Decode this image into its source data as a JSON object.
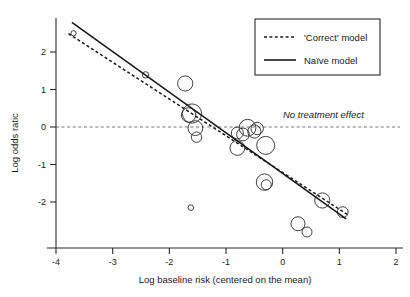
{
  "chart_data": {
    "type": "scatter",
    "title": "",
    "xlabel": "Log baseline risk (centered on the mean)",
    "ylabel": "Log odds ratic",
    "xlim": [
      -4.35,
      2.15
    ],
    "ylim": [
      -3.05,
      2.85
    ],
    "xticks": [
      -4,
      -3,
      -2,
      -1,
      0,
      1,
      2
    ],
    "xticklabels": [
      "-4",
      "-3",
      "-2",
      "-1",
      "0",
      "1",
      "2"
    ],
    "yticks": [
      2,
      1,
      0,
      -1,
      -2
    ],
    "yticklabels": [
      "2",
      "1",
      "0",
      "-1",
      "-2"
    ],
    "grid": false,
    "legend_position": "top-right",
    "annotations": [
      {
        "text": "No treatment effect",
        "x": 0.1,
        "y": 0.18,
        "style": "italic"
      }
    ],
    "reference_lines": [
      {
        "name": "no-treatment-effect",
        "orientation": "horizontal",
        "y": 0,
        "style": "dotted",
        "color": "#777777"
      }
    ],
    "series": [
      {
        "name": "Studies",
        "type": "bubble",
        "marker": "open-circle",
        "points": [
          {
            "x": -3.69,
            "y": 2.5,
            "size": 2.6
          },
          {
            "x": -2.42,
            "y": 1.39,
            "size": 3.2
          },
          {
            "x": -1.72,
            "y": 1.16,
            "size": 7.6
          },
          {
            "x": -1.6,
            "y": 0.36,
            "size": 9.6
          },
          {
            "x": -1.66,
            "y": 0.32,
            "size": 7.2
          },
          {
            "x": -1.54,
            "y": -0.03,
            "size": 7.4
          },
          {
            "x": -1.52,
            "y": -0.27,
            "size": 5.2
          },
          {
            "x": -0.8,
            "y": -0.16,
            "size": 6.0
          },
          {
            "x": -0.7,
            "y": -0.2,
            "size": 6.4
          },
          {
            "x": -0.62,
            "y": -0.02,
            "size": 8.4
          },
          {
            "x": -0.5,
            "y": -0.12,
            "size": 6.6
          },
          {
            "x": -0.45,
            "y": -0.04,
            "size": 6.2
          },
          {
            "x": -0.8,
            "y": -0.56,
            "size": 7.4
          },
          {
            "x": -0.3,
            "y": -0.49,
            "size": 9.0
          },
          {
            "x": -0.32,
            "y": -1.47,
            "size": 8.2
          },
          {
            "x": -0.29,
            "y": -1.54,
            "size": 5.0
          },
          {
            "x": -1.62,
            "y": -2.15,
            "size": 2.8
          },
          {
            "x": 0.7,
            "y": -1.96,
            "size": 7.6
          },
          {
            "x": 1.06,
            "y": -2.27,
            "size": 5.4
          },
          {
            "x": 0.27,
            "y": -2.58,
            "size": 7.0
          },
          {
            "x": 0.43,
            "y": -2.8,
            "size": 5.0
          }
        ]
      }
    ],
    "fitted_lines": [
      {
        "name": "Naïve model",
        "style": "solid",
        "x0": -3.72,
        "y0": 2.79,
        "x1": 1.12,
        "y1": -2.45
      },
      {
        "name": "'Correct' model",
        "style": "dotted",
        "x0": -3.78,
        "y0": 2.49,
        "x1": 1.15,
        "y1": -2.34
      }
    ]
  },
  "legend": {
    "entries": [
      {
        "label": "'Correct' model",
        "style": "dotted"
      },
      {
        "label": "Naïve model",
        "style": "solid"
      }
    ]
  }
}
